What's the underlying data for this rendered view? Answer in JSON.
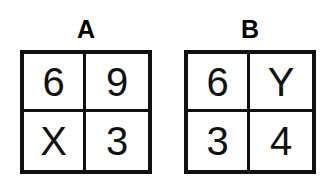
{
  "figure": {
    "background_color": "#ffffff",
    "ink_color": "#111111"
  },
  "groups": [
    {
      "label": "A",
      "rows": [
        [
          {
            "text": "6",
            "kind": "digit"
          },
          {
            "text": "9",
            "kind": "digit"
          }
        ],
        [
          {
            "text": "X",
            "kind": "letter"
          },
          {
            "text": "3",
            "kind": "digit"
          }
        ]
      ]
    },
    {
      "label": "B",
      "rows": [
        [
          {
            "text": "6",
            "kind": "digit"
          },
          {
            "text": "Y",
            "kind": "letter"
          }
        ],
        [
          {
            "text": "3",
            "kind": "digit"
          },
          {
            "text": "4",
            "kind": "digit"
          }
        ]
      ]
    }
  ]
}
